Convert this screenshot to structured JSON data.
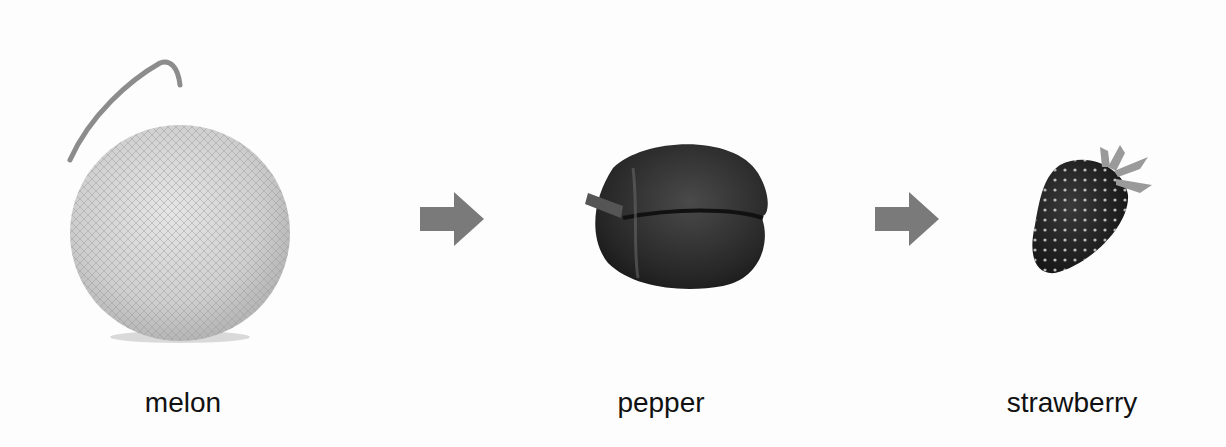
{
  "sequence": {
    "items": [
      {
        "label": "melon",
        "icon": "melon-icon"
      },
      {
        "label": "pepper",
        "icon": "pepper-icon"
      },
      {
        "label": "strawberry",
        "icon": "strawberry-icon"
      }
    ],
    "connectors": [
      {
        "icon": "right-arrow-icon"
      },
      {
        "icon": "right-arrow-icon"
      }
    ]
  },
  "colors": {
    "background": "#fdfdfd",
    "arrow": "#7a7a7a",
    "text": "#111111"
  }
}
